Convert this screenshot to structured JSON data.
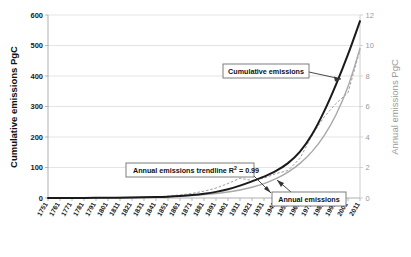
{
  "chart_data": {
    "type": "line",
    "title": "",
    "xlabel": "",
    "ylabel": "Cumulative emissions PgC",
    "y2label": "Annual emissions PgC",
    "grid": true,
    "legend_position": "annotations-inline",
    "x_tick_labels": [
      "1751",
      "1761",
      "1771",
      "1781",
      "1791",
      "1801",
      "1811",
      "1821",
      "1831",
      "1841",
      "1851",
      "1861",
      "1871",
      "1881",
      "1891",
      "1901",
      "1911",
      "1921",
      "1931",
      "1941",
      "1951",
      "1961",
      "1971",
      "1981",
      "1991",
      "2001",
      "2011"
    ],
    "y_left_ticks": [
      0,
      100,
      200,
      300,
      400,
      500,
      600
    ],
    "y_right_ticks": [
      0,
      2,
      4,
      6,
      8,
      10,
      12
    ],
    "ylim": [
      0,
      600
    ],
    "y2lim": [
      0,
      12
    ],
    "xlim": [
      1751,
      2011
    ],
    "series": [
      {
        "name": "Cumulative emissions",
        "axis": "left",
        "style": "solid",
        "color": "#1a1a1a",
        "x": [
          1751,
          1761,
          1771,
          1781,
          1791,
          1801,
          1811,
          1821,
          1831,
          1841,
          1851,
          1861,
          1871,
          1881,
          1891,
          1901,
          1911,
          1921,
          1931,
          1941,
          1951,
          1961,
          1971,
          1981,
          1991,
          2001,
          2011
        ],
        "values": [
          0,
          0.3,
          0.7,
          1.2,
          1.8,
          2.6,
          3.6,
          4.9,
          6.7,
          9.3,
          13,
          19,
          28,
          41,
          59,
          84,
          119,
          160,
          205,
          260,
          335,
          445,
          610,
          830,
          1090,
          1380,
          1700
        ]
      },
      {
        "name": "Annual emissions trendline",
        "axis": "right",
        "style": "solid",
        "color": "#a8a8a8",
        "r_squared": 0.99,
        "x": [
          1751,
          1761,
          1771,
          1781,
          1791,
          1801,
          1811,
          1821,
          1831,
          1841,
          1851,
          1861,
          1871,
          1881,
          1891,
          1901,
          1911,
          1921,
          1931,
          1941,
          1951,
          1961,
          1971,
          1981,
          1991,
          2001,
          2011
        ],
        "values": [
          0.01,
          0.02,
          0.02,
          0.03,
          0.04,
          0.05,
          0.07,
          0.09,
          0.12,
          0.16,
          0.22,
          0.3,
          0.4,
          0.54,
          0.72,
          0.97,
          1.3,
          1.74,
          2.33,
          3.12,
          4.18,
          5.6,
          7.5,
          10.05,
          13.46,
          18.03,
          24.16
        ]
      },
      {
        "name": "Annual emissions",
        "axis": "right",
        "style": "dashed",
        "color": "#9e9e9e",
        "x": [
          1751,
          1761,
          1771,
          1781,
          1791,
          1801,
          1811,
          1821,
          1831,
          1841,
          1851,
          1861,
          1871,
          1881,
          1891,
          1901,
          1911,
          1921,
          1931,
          1941,
          1951,
          1961,
          1971,
          1981,
          1991,
          2001,
          2011
        ],
        "values": [
          0.003,
          0.004,
          0.005,
          0.007,
          0.009,
          0.012,
          0.02,
          0.03,
          0.05,
          0.08,
          0.13,
          0.2,
          0.3,
          0.45,
          0.65,
          0.95,
          1.3,
          1.15,
          1.3,
          1.6,
          1.8,
          2.6,
          4.1,
          5.3,
          6.2,
          6.9,
          9.7
        ]
      }
    ],
    "annotations": [
      {
        "id": "cumulative",
        "label": "Cumulative emissions"
      },
      {
        "id": "trendline",
        "label_prefix": "Annual emissions trendline R",
        "label_sup": "2",
        "label_suffix": "= 0.99"
      },
      {
        "id": "annual",
        "label": "Annual emissions"
      }
    ]
  },
  "axes": {
    "left_title": "Cumulative emissions PgC",
    "right_title": "Annual emissions PgC"
  },
  "colors": {
    "cumulative": "#1a1a1a",
    "annual_trend": "#a8a8a8",
    "annual_data": "#9e9e9e",
    "grid": "#d9d9d9",
    "right_axis_text": "#9a9a9a"
  }
}
